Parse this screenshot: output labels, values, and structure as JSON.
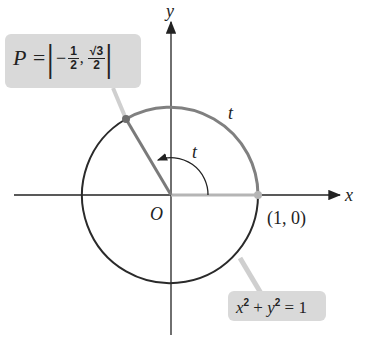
{
  "diagram": {
    "axes": {
      "x_label": "x",
      "y_label": "y"
    },
    "origin_label": "O",
    "point_1_0_label": "(1, 0)",
    "arc_label": "t",
    "angle_label": "t",
    "point_P": {
      "prefix": "P = ",
      "x_sign": "−",
      "x_num": "1",
      "x_den": "2",
      "y_num": "√3",
      "y_den": "2"
    },
    "equation": {
      "text_a": "x",
      "exp_a": "2",
      "plus": " + ",
      "text_b": "y",
      "exp_b": "2",
      "rhs": " = 1"
    },
    "colors": {
      "axis": "#222222",
      "circle_dark": "#2a2a2a",
      "circle_gray": "#808080",
      "callout_bg": "#d9d9d9",
      "radius_gray": "#7a7a7a",
      "baseline_gray": "#b5b5b5"
    }
  }
}
